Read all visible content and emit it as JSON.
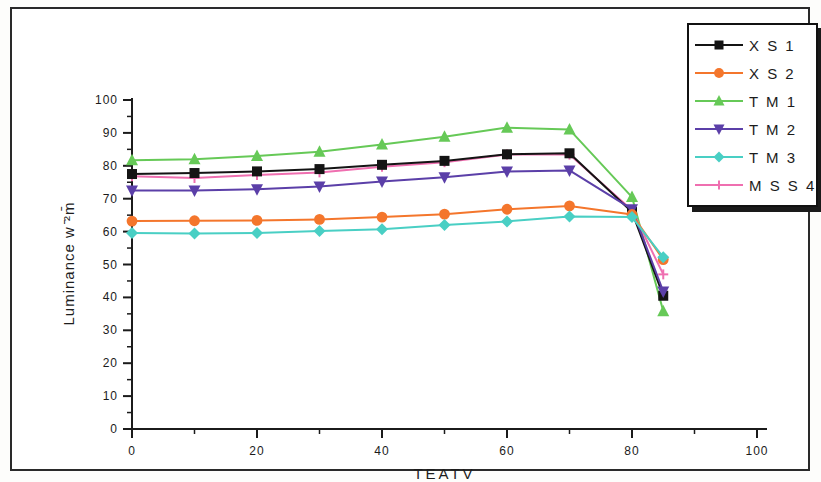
{
  "figure": {
    "background_color": "#ffffff",
    "frame_color": "#2a2a2a"
  },
  "axes": {
    "x_label": "TEATV",
    "y_label": "Luminance w ̄²m̄",
    "x_ticks": [
      "0",
      "20",
      "40",
      "60",
      "80",
      "100"
    ],
    "y_ticks": [
      "0",
      "10",
      "20",
      "30",
      "40",
      "50",
      "60",
      "70",
      "80",
      "90",
      "100"
    ]
  },
  "legend": {
    "items": [
      {
        "label": "X S 1",
        "color": "#141414",
        "marker": "square"
      },
      {
        "label": "X S 2",
        "color": "#f4762c",
        "marker": "circle"
      },
      {
        "label": "T M 1",
        "color": "#66c957",
        "marker": "triangle-up"
      },
      {
        "label": "T M 2",
        "color": "#5b3fa8",
        "marker": "triangle-down"
      },
      {
        "label": "T M 3",
        "color": "#49cfc4",
        "marker": "diamond"
      },
      {
        "label": "M S S 4",
        "color": "#ef6fb0",
        "marker": "plus"
      }
    ]
  },
  "chart_data": {
    "type": "line",
    "title": "",
    "xlabel": "TEATV",
    "ylabel": "Luminance w ̄²m̄",
    "xlim": [
      0,
      100
    ],
    "ylim": [
      0,
      100
    ],
    "xticks": [
      0,
      20,
      40,
      60,
      80,
      100
    ],
    "yticks": [
      0,
      10,
      20,
      30,
      40,
      50,
      60,
      70,
      80,
      90,
      100
    ],
    "grid": false,
    "legend_position": "upper-right",
    "x": [
      0,
      10,
      20,
      30,
      40,
      50,
      60,
      70,
      80,
      85
    ],
    "series": [
      {
        "name": "X S 1",
        "color": "#141414",
        "marker": "square",
        "values": [
          77.5,
          77.8,
          78.3,
          79.0,
          80.3,
          81.5,
          83.5,
          83.8,
          66.0,
          40.5
        ]
      },
      {
        "name": "X S 2",
        "color": "#f4762c",
        "marker": "circle",
        "values": [
          63.2,
          63.3,
          63.4,
          63.7,
          64.4,
          65.3,
          66.8,
          67.8,
          65.2,
          51.5
        ]
      },
      {
        "name": "T M 1",
        "color": "#66c957",
        "marker": "triangle-up",
        "values": [
          81.7,
          82.0,
          83.0,
          84.3,
          86.5,
          88.8,
          91.6,
          91.0,
          70.5,
          35.8
        ]
      },
      {
        "name": "T M 2",
        "color": "#5b3fa8",
        "marker": "triangle-down",
        "values": [
          72.5,
          72.5,
          72.9,
          73.7,
          75.2,
          76.5,
          78.3,
          78.6,
          66.8,
          41.8
        ]
      },
      {
        "name": "T M 3",
        "color": "#49cfc4",
        "marker": "diamond",
        "values": [
          59.6,
          59.4,
          59.6,
          60.2,
          60.7,
          62.0,
          63.1,
          64.6,
          64.4,
          52.2
        ]
      },
      {
        "name": "M S S 4",
        "color": "#ef6fb0",
        "marker": "plus",
        "values": [
          76.8,
          76.3,
          77.2,
          78.0,
          79.7,
          81.1,
          83.4,
          83.4,
          66.5,
          47.0
        ]
      }
    ]
  }
}
